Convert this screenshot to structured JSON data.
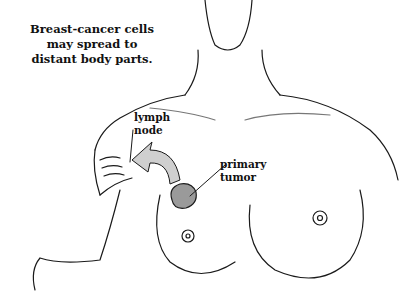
{
  "caption": {
    "lines": [
      "Breast-cancer cells",
      "may spread to",
      "distant body parts."
    ]
  },
  "labels": {
    "lymph_node": [
      "lymph",
      "node"
    ],
    "primary_tumor": [
      "primary",
      "tumor"
    ]
  },
  "colors": {
    "ink": "#1a1a1a",
    "shading": "#9a9a9a",
    "background": "#ffffff"
  }
}
